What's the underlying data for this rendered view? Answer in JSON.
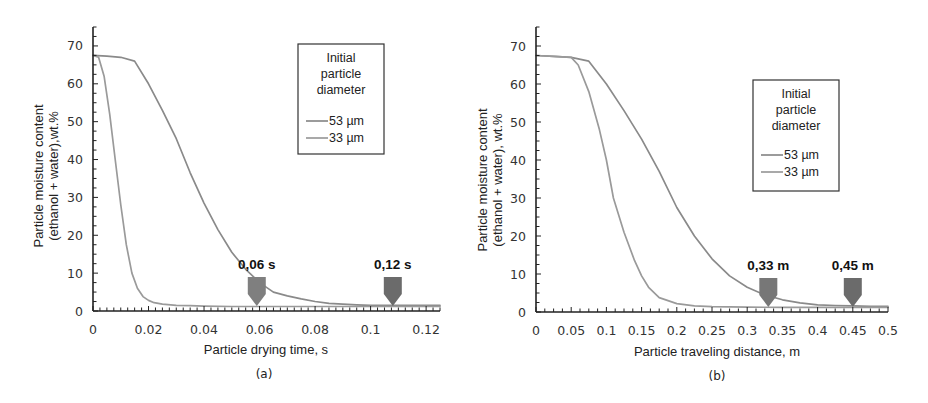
{
  "chart_data": [
    {
      "panel": "(a)",
      "type": "line",
      "title": "",
      "xlabel": "Particle drying time, s",
      "ylabel_line1": "Particle moisture content",
      "ylabel_line2": "(ethanol + water),wt.%",
      "xlim": [
        0,
        0.125
      ],
      "ylim": [
        0,
        75
      ],
      "x_ticks": [
        "0",
        "0.02",
        "0.04",
        "0.06",
        "0.08",
        "0.1",
        "0.12"
      ],
      "x_tick_values": [
        0,
        0.02,
        0.04,
        0.06,
        0.08,
        0.1,
        0.12
      ],
      "y_ticks": [
        "0",
        "10",
        "20",
        "30",
        "40",
        "50",
        "60",
        "70"
      ],
      "y_tick_values": [
        0,
        10,
        20,
        30,
        40,
        50,
        60,
        70
      ],
      "grid": false,
      "legend": {
        "title_lines": [
          "Initial",
          "particle",
          "diameter"
        ],
        "position": "upper right",
        "entries": [
          "53 µm",
          "33 µm"
        ]
      },
      "series": [
        {
          "name": "53 µm",
          "color": "#8a8a8a",
          "x": [
            0,
            0.005,
            0.01,
            0.015,
            0.02,
            0.025,
            0.03,
            0.035,
            0.04,
            0.045,
            0.05,
            0.055,
            0.06,
            0.065,
            0.07,
            0.075,
            0.08,
            0.085,
            0.09,
            0.095,
            0.1,
            0.105,
            0.11,
            0.115,
            0.12,
            0.125
          ],
          "y": [
            67.5,
            67.3,
            67.0,
            66.0,
            60.0,
            53.0,
            45.5,
            36.5,
            28.5,
            21.5,
            15.5,
            11.0,
            7.5,
            5.0,
            4.0,
            3.2,
            2.5,
            2.0,
            1.8,
            1.6,
            1.5,
            1.5,
            1.5,
            1.5,
            1.5,
            1.5
          ]
        },
        {
          "name": "33 µm",
          "color": "#9a9a9a",
          "x": [
            0,
            0.002,
            0.004,
            0.006,
            0.008,
            0.01,
            0.012,
            0.014,
            0.016,
            0.018,
            0.02,
            0.022,
            0.025,
            0.03,
            0.035,
            0.04,
            0.05,
            0.06,
            0.08,
            0.1,
            0.125
          ],
          "y": [
            67.5,
            67.0,
            62.0,
            52.0,
            40.0,
            28.0,
            17.5,
            10.0,
            6.0,
            3.8,
            2.8,
            2.2,
            1.8,
            1.5,
            1.4,
            1.3,
            1.2,
            1.2,
            1.2,
            1.2,
            1.2
          ]
        }
      ],
      "annotations": [
        {
          "text": "0,06 s",
          "x": 0.059,
          "type": "down-arrow",
          "color": "#7f7f7f"
        },
        {
          "text": "0,12 s",
          "x": 0.108,
          "type": "down-arrow",
          "color": "#6b6b6b"
        }
      ]
    },
    {
      "panel": "(b)",
      "type": "line",
      "title": "",
      "xlabel": "Particle traveling distance, m",
      "ylabel_line1": "Particle moisture content",
      "ylabel_line2": "(ethanol + water), wt.%",
      "xlim": [
        0,
        0.5
      ],
      "ylim": [
        0,
        75
      ],
      "x_ticks": [
        "0",
        "0.05",
        "0.1",
        "0.15",
        "0.2",
        "0.25",
        "0.3",
        "0.35",
        "0.4",
        "0.45",
        "0.5"
      ],
      "x_tick_values": [
        0,
        0.05,
        0.1,
        0.15,
        0.2,
        0.25,
        0.3,
        0.35,
        0.4,
        0.45,
        0.5
      ],
      "y_ticks": [
        "0",
        "10",
        "20",
        "30",
        "40",
        "50",
        "60",
        "70"
      ],
      "y_tick_values": [
        0,
        10,
        20,
        30,
        40,
        50,
        60,
        70
      ],
      "grid": false,
      "legend": {
        "title_lines": [
          "Initial",
          "particle",
          "diameter"
        ],
        "position": "center right",
        "entries": [
          "53 µm",
          "33 µm"
        ]
      },
      "series": [
        {
          "name": "53 µm",
          "color": "#8a8a8a",
          "x": [
            0,
            0.025,
            0.05,
            0.075,
            0.1,
            0.125,
            0.15,
            0.175,
            0.2,
            0.225,
            0.25,
            0.275,
            0.3,
            0.325,
            0.35,
            0.375,
            0.4,
            0.425,
            0.45,
            0.475,
            0.5
          ],
          "y": [
            67.5,
            67.3,
            67.0,
            66.0,
            60.0,
            53.0,
            45.5,
            37.0,
            27.5,
            20.0,
            14.0,
            9.5,
            6.5,
            4.5,
            3.2,
            2.4,
            1.9,
            1.7,
            1.6,
            1.5,
            1.5
          ]
        },
        {
          "name": "33 µm",
          "color": "#9a9a9a",
          "x": [
            0,
            0.025,
            0.05,
            0.06,
            0.075,
            0.09,
            0.1,
            0.11,
            0.125,
            0.14,
            0.15,
            0.16,
            0.175,
            0.2,
            0.225,
            0.25,
            0.3,
            0.35,
            0.4,
            0.45,
            0.5
          ],
          "y": [
            67.5,
            67.3,
            67.0,
            65.0,
            58.0,
            48.0,
            40.0,
            30.0,
            21.0,
            13.5,
            9.5,
            6.5,
            3.8,
            2.2,
            1.6,
            1.4,
            1.3,
            1.2,
            1.2,
            1.2,
            1.2
          ]
        }
      ],
      "annotations": [
        {
          "text": "0,33 m",
          "x": 0.33,
          "type": "down-arrow",
          "color": "#777777"
        },
        {
          "text": "0,45 m",
          "x": 0.45,
          "type": "down-arrow",
          "color": "#6b6b6b"
        }
      ]
    }
  ]
}
